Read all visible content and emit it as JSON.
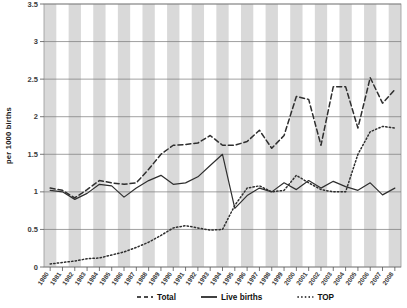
{
  "chart_data": {
    "type": "line",
    "title": "",
    "xlabel": "",
    "ylabel": "per 1000 births",
    "ylim": [
      0,
      3.5
    ],
    "ytick_labels": [
      "0",
      "0.5",
      "1",
      "1.5",
      "2",
      "2.5",
      "3",
      "3.5"
    ],
    "ytick_values": [
      0,
      0.5,
      1,
      1.5,
      2,
      2.5,
      3,
      3.5
    ],
    "grid": true,
    "legend_position": "bottom",
    "banding": "alternating vertical grey bands per year",
    "categories": [
      "1980",
      "1981",
      "1982",
      "1983",
      "1984",
      "1985",
      "1986",
      "1987",
      "1988",
      "1989",
      "1990",
      "1991",
      "1992",
      "1993",
      "1994",
      "1995",
      "1996",
      "1997",
      "1998",
      "1999",
      "2000",
      "2001",
      "2002",
      "2003",
      "2004",
      "2005",
      "2006",
      "2007",
      "2008"
    ],
    "series": [
      {
        "name": "Total",
        "style": "dashed",
        "color": "#2f2f2f",
        "values": [
          1.05,
          1.02,
          0.92,
          1.03,
          1.15,
          1.12,
          1.1,
          1.12,
          1.3,
          1.5,
          1.62,
          1.63,
          1.65,
          1.75,
          1.62,
          1.62,
          1.67,
          1.82,
          1.58,
          1.75,
          2.27,
          2.23,
          1.62,
          2.4,
          2.4,
          1.85,
          2.52,
          2.18,
          2.36
        ]
      },
      {
        "name": "Live births",
        "style": "solid",
        "color": "#2f2f2f",
        "values": [
          1.02,
          1.0,
          0.9,
          0.98,
          1.1,
          1.08,
          0.93,
          1.05,
          1.15,
          1.22,
          1.1,
          1.12,
          1.2,
          1.35,
          1.5,
          0.78,
          0.95,
          1.05,
          1.0,
          1.12,
          1.03,
          1.15,
          1.05,
          1.14,
          1.07,
          1.02,
          1.12,
          0.96,
          1.05
        ]
      },
      {
        "name": "TOP",
        "style": "dotted",
        "color": "#2f2f2f",
        "values": [
          0.04,
          0.06,
          0.08,
          0.11,
          0.12,
          0.16,
          0.2,
          0.26,
          0.33,
          0.42,
          0.52,
          0.55,
          0.52,
          0.49,
          0.5,
          0.82,
          1.05,
          1.08,
          1.0,
          1.02,
          1.22,
          1.12,
          1.03,
          1.0,
          1.0,
          1.5,
          1.8,
          1.87,
          1.85
        ]
      }
    ],
    "legend": [
      {
        "label": "Total",
        "style": "dashed"
      },
      {
        "label": "Live births",
        "style": "solid"
      },
      {
        "label": "TOP",
        "style": "dotted"
      }
    ]
  }
}
